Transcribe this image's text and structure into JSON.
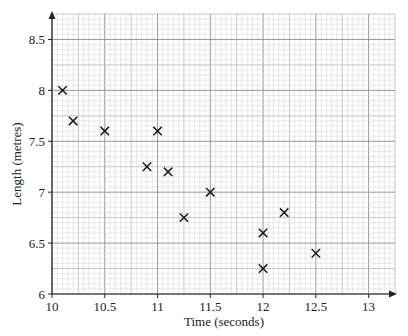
{
  "chart_data": {
    "type": "scatter",
    "title": "",
    "xlabel": "Time (seconds)",
    "ylabel": "Length (metres)",
    "xlim": [
      10,
      13.25
    ],
    "ylim": [
      6,
      8.75
    ],
    "x_ticks": [
      10,
      10.5,
      11,
      11.5,
      12,
      12.5,
      13
    ],
    "x_tick_labels": [
      "10",
      "10.5",
      "11",
      "11.5",
      "12",
      "12.5",
      "13"
    ],
    "y_ticks": [
      6,
      6.5,
      7,
      7.5,
      8,
      8.5
    ],
    "y_tick_labels": [
      "6",
      "6.5",
      "7",
      "7.5",
      "8",
      "8.5"
    ],
    "grid": {
      "on": true,
      "major_step": 0.5,
      "mid_step": 0.25,
      "minor_step": 0.05
    },
    "marker": "x",
    "series": [
      {
        "name": "data",
        "points": [
          {
            "x": 10.1,
            "y": 8.0
          },
          {
            "x": 10.2,
            "y": 7.7
          },
          {
            "x": 10.5,
            "y": 7.6
          },
          {
            "x": 11.0,
            "y": 7.6
          },
          {
            "x": 10.9,
            "y": 7.25
          },
          {
            "x": 11.1,
            "y": 7.2
          },
          {
            "x": 11.25,
            "y": 6.75
          },
          {
            "x": 11.5,
            "y": 7.0
          },
          {
            "x": 12.0,
            "y": 6.6
          },
          {
            "x": 12.2,
            "y": 6.8
          },
          {
            "x": 12.0,
            "y": 6.25
          },
          {
            "x": 12.5,
            "y": 6.4
          }
        ]
      }
    ],
    "legend": null
  },
  "colors": {
    "axis": "#222222",
    "grid_minor": "#d4d4d4",
    "grid_mid": "#b0b0b0",
    "grid_major": "#8c8c8c",
    "marker": "#1a1a1a"
  }
}
